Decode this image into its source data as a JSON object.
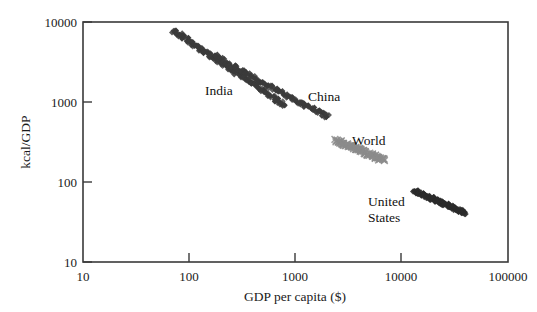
{
  "chart_data": {
    "type": "scatter",
    "title": "",
    "subtitle": "",
    "xlabel": "GDP per capita ($)",
    "ylabel": "kcal/GDP",
    "xscale": "log",
    "yscale": "log",
    "xlim": [
      10,
      100000
    ],
    "ylim": [
      10,
      10000
    ],
    "xticks": [
      10,
      100,
      1000,
      10000,
      100000
    ],
    "xtick_labels": [
      "10",
      "100",
      "1000",
      "10000",
      "100000"
    ],
    "yticks": [
      10,
      100,
      1000,
      10000
    ],
    "ytick_labels": [
      "10",
      "100",
      "1000",
      "10000"
    ],
    "grid": false,
    "legend_position": "none",
    "annotations": [
      {
        "text": "India",
        "x": 260,
        "y": 1600,
        "name": "india"
      },
      {
        "text": "China",
        "x": 1500,
        "y": 1150,
        "name": "china"
      },
      {
        "text": "World",
        "x": 3500,
        "y": 330,
        "name": "world"
      },
      {
        "text": "United States",
        "line1": "United",
        "line2": "States",
        "x": 8000,
        "y": 62,
        "name": "united-states"
      }
    ],
    "series": [
      {
        "name": "India",
        "color": "#3b3b3b",
        "marker": "diamond",
        "point_count": 46,
        "x": [
          70,
          74,
          78,
          82,
          86,
          91,
          96,
          101,
          107,
          113,
          119,
          126,
          133,
          140,
          148,
          156,
          165,
          174,
          184,
          194,
          205,
          216,
          228,
          241,
          254,
          268,
          283,
          299,
          316,
          333,
          352,
          371,
          392,
          414,
          437,
          461,
          487,
          514,
          543,
          573,
          605,
          639,
          675,
          713,
          753,
          795
        ],
        "y": [
          7800,
          7500,
          7300,
          6900,
          6600,
          6300,
          6000,
          5700,
          5400,
          5100,
          4900,
          4700,
          4500,
          4300,
          4100,
          3900,
          3700,
          3500,
          3350,
          3200,
          3050,
          2900,
          2750,
          2620,
          2500,
          2380,
          2270,
          2160,
          2060,
          1960,
          1870,
          1780,
          1700,
          1620,
          1545,
          1470,
          1400,
          1335,
          1275,
          1215,
          1160,
          1105,
          1055,
          1005,
          960,
          915
        ]
      },
      {
        "name": "China",
        "color": "#3b3b3b",
        "marker": "diamond",
        "point_count": 40,
        "x": [
          170,
          183,
          197,
          212,
          228,
          245,
          264,
          284,
          306,
          329,
          354,
          381,
          410,
          441,
          475,
          511,
          550,
          592,
          637,
          686,
          738,
          794,
          855,
          920,
          990,
          1065,
          1146,
          1234,
          1328,
          1429,
          1538,
          1655,
          1781,
          1917,
          2063
        ],
        "y": [
          3900,
          3680,
          3480,
          3290,
          3110,
          2940,
          2780,
          2630,
          2490,
          2355,
          2230,
          2110,
          1995,
          1890,
          1790,
          1695,
          1605,
          1520,
          1440,
          1365,
          1295,
          1230,
          1165,
          1105,
          1050,
          1000,
          950,
          905,
          860,
          820,
          780,
          745,
          710,
          680,
          650
        ]
      },
      {
        "name": "World",
        "color": "#8c8c8c",
        "marker": "cross",
        "point_count": 40,
        "x": [
          2400,
          2520,
          2640,
          2770,
          2900,
          3040,
          3190,
          3340,
          3500,
          3670,
          3850,
          4030,
          4230,
          4430,
          4640,
          4870,
          5100,
          5350,
          5600,
          5870,
          6150,
          6450,
          6760
        ],
        "y": [
          330,
          322,
          314,
          306,
          298,
          290,
          283,
          276,
          269,
          262,
          255,
          249,
          243,
          236,
          230,
          225,
          219,
          214,
          208,
          203,
          198,
          193,
          188
        ]
      },
      {
        "name": "United States",
        "color": "#2b2b2b",
        "marker": "diamond",
        "point_count": 45,
        "x": [
          13000,
          13600,
          14200,
          14900,
          15600,
          16300,
          17100,
          17900,
          18700,
          19600,
          20500,
          21400,
          22400,
          23400,
          24500,
          25600,
          26800,
          28000,
          29300,
          30600,
          32000,
          33500,
          35000,
          36600,
          38200,
          40000
        ],
        "y": [
          78,
          76,
          74,
          72,
          70,
          68,
          66,
          64.5,
          63,
          61.5,
          60,
          58.5,
          57,
          55.5,
          54,
          52.5,
          51,
          50,
          48.5,
          47.5,
          46,
          45,
          44,
          43,
          42,
          41
        ]
      }
    ]
  },
  "figure": {
    "xlabel": "GDP per capita ($)",
    "ylabel": "kcal/GDP"
  }
}
